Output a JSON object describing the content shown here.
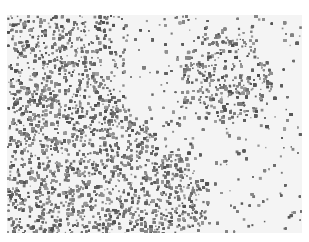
{
  "image": {
    "subject": "grayscale histology micrograph of densely packed cells",
    "description": "Dense cellular regions at upper-left and lower-left, a rounded dense cluster (follicle-like) at upper-right, with sparse scattered cells and pale background between them",
    "colors": {
      "background": "#f4f4f4",
      "dense_cell": "#6e6e6e",
      "sparse_cell": "#7a7a7a"
    },
    "regions": [
      {
        "name": "upper-left-dense-area",
        "density": "high"
      },
      {
        "name": "upper-right-round-cluster",
        "density": "high"
      },
      {
        "name": "lower-left-dense-area",
        "density": "very high"
      },
      {
        "name": "center-and-right-sparse-area",
        "density": "low"
      }
    ]
  }
}
